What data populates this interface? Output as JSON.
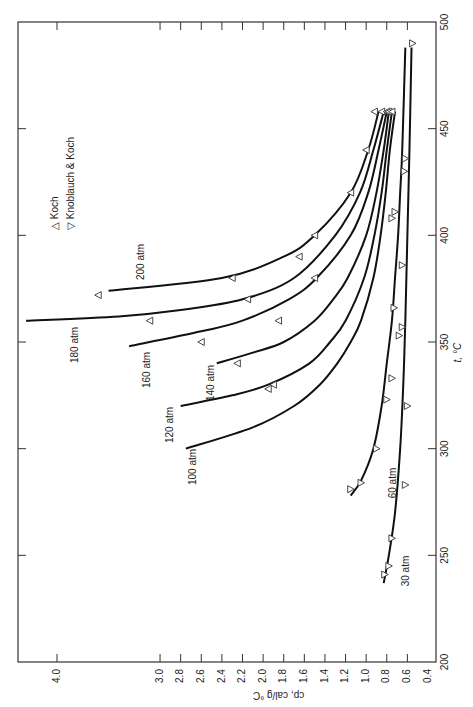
{
  "chart_data": {
    "type": "line",
    "title": "",
    "xlabel": "t, °C",
    "ylabel": "cp, cal/g °C",
    "xlim": [
      200,
      500
    ],
    "ylim": [
      0.4,
      4.0
    ],
    "x_ticks": [
      200,
      250,
      300,
      350,
      400,
      450,
      500
    ],
    "y_ticks": [
      0.4,
      0.6,
      0.8,
      1.0,
      1.2,
      1.4,
      1.6,
      1.8,
      2.0,
      2.2,
      2.4,
      2.6,
      2.8,
      3.0,
      4.0
    ],
    "orientation": "rotated 90° clockwise (t axis vertical on right, cp axis horizontal along bottom)",
    "grid": false,
    "legend": {
      "position": "upper-left (rotated)",
      "entries": [
        {
          "symbol": "△",
          "label": "Koch"
        },
        {
          "symbol": "▽",
          "label": "Knoblauch & Koch"
        }
      ]
    },
    "series": [
      {
        "name": "30 atm",
        "x": [
          237,
          250,
          270,
          300,
          330,
          360,
          400,
          440,
          488
        ],
        "y": [
          0.83,
          0.78,
          0.72,
          0.67,
          0.64,
          0.62,
          0.6,
          0.58,
          0.56
        ]
      },
      {
        "name": "60 atm",
        "x": [
          278,
          285,
          300,
          320,
          340,
          360,
          380,
          400,
          420,
          440,
          488
        ],
        "y": [
          1.15,
          1.05,
          0.93,
          0.85,
          0.8,
          0.75,
          0.72,
          0.69,
          0.67,
          0.65,
          0.62
        ]
      },
      {
        "name": "100 atm",
        "x": [
          300,
          310,
          320,
          330,
          340,
          350,
          360,
          380,
          400,
          420,
          440,
          458
        ],
        "y": [
          2.75,
          2.1,
          1.7,
          1.45,
          1.28,
          1.15,
          1.05,
          0.93,
          0.86,
          0.81,
          0.77,
          0.72
        ]
      },
      {
        "name": "120 atm",
        "x": [
          320,
          325,
          330,
          340,
          350,
          360,
          380,
          400,
          420,
          440,
          458
        ],
        "y": [
          2.8,
          2.3,
          1.95,
          1.55,
          1.35,
          1.2,
          1.02,
          0.92,
          0.85,
          0.8,
          0.75
        ]
      },
      {
        "name": "140 atm",
        "x": [
          340,
          345,
          350,
          360,
          370,
          380,
          400,
          420,
          440,
          458
        ],
        "y": [
          2.45,
          2.1,
          1.8,
          1.5,
          1.32,
          1.18,
          1.0,
          0.9,
          0.83,
          0.78
        ]
      },
      {
        "name": "160 atm",
        "x": [
          348,
          355,
          360,
          370,
          380,
          400,
          420,
          440,
          458
        ],
        "y": [
          3.3,
          2.6,
          2.2,
          1.75,
          1.48,
          1.15,
          0.98,
          0.88,
          0.8
        ]
      },
      {
        "name": "180 atm",
        "x": [
          360,
          362,
          365,
          370,
          380,
          400,
          420,
          440,
          458
        ],
        "y": [
          4.3,
          3.4,
          2.8,
          2.2,
          1.7,
          1.3,
          1.06,
          0.93,
          0.83
        ]
      },
      {
        "name": "200 atm",
        "x": [
          374,
          380,
          390,
          400,
          420,
          440,
          458
        ],
        "y": [
          3.5,
          2.4,
          1.8,
          1.5,
          1.15,
          0.98,
          0.88
        ]
      }
    ],
    "points": {
      "koch": [
        [
          372,
          3.6
        ],
        [
          360,
          3.1
        ],
        [
          380,
          2.3
        ],
        [
          370,
          2.15
        ],
        [
          360,
          1.85
        ],
        [
          350,
          2.6
        ],
        [
          340,
          2.25
        ],
        [
          328,
          1.95
        ],
        [
          330,
          1.9
        ],
        [
          400,
          1.5
        ],
        [
          390,
          1.65
        ],
        [
          380,
          1.5
        ],
        [
          420,
          1.15
        ],
        [
          440,
          1.0
        ],
        [
          458,
          0.92
        ],
        [
          458,
          0.85
        ],
        [
          458,
          0.8
        ],
        [
          458,
          0.78
        ],
        [
          458,
          0.75
        ]
      ],
      "knoblauch_koch": [
        [
          281,
          1.15
        ],
        [
          284,
          1.05
        ],
        [
          300,
          0.9
        ],
        [
          323,
          0.8
        ],
        [
          333,
          0.75
        ],
        [
          353,
          0.68
        ],
        [
          366,
          0.73
        ],
        [
          386,
          0.65
        ],
        [
          408,
          0.75
        ],
        [
          411,
          0.72
        ],
        [
          430,
          0.63
        ],
        [
          436,
          0.62
        ],
        [
          490,
          0.55
        ],
        [
          283,
          0.62
        ],
        [
          320,
          0.6
        ],
        [
          357,
          0.65
        ],
        [
          258,
          0.75
        ],
        [
          245,
          0.78
        ],
        [
          241,
          0.82
        ]
      ]
    },
    "annotations": [
      "30 atm",
      "60 atm",
      "100 atm",
      "120 atm",
      "140 atm",
      "160 atm",
      "180 atm",
      "200 atm"
    ]
  },
  "labels": {
    "x_axis_title": "t, °C",
    "y_axis_title": "cp, cal/g °C",
    "legend_koch": "Koch",
    "legend_kk": "Knoblauch & Koch",
    "legend_koch_sym": "△",
    "legend_kk_sym": "▽"
  }
}
